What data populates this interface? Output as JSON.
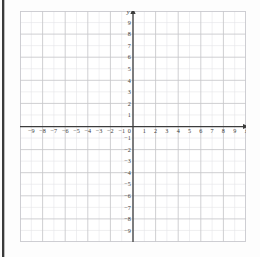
{
  "page": {
    "background_color": "#fdfdfd",
    "binding_edge_color": "#3a3a3a"
  },
  "chart_data": {
    "type": "scatter",
    "title": "",
    "subtitle": "",
    "xlabel": "x",
    "ylabel": "y",
    "xlim": [
      -10,
      10
    ],
    "ylim": [
      -10,
      10
    ],
    "x_tick_labels": [
      "-9",
      "-8",
      "-7",
      "-6",
      "-5",
      "-4",
      "-3",
      "-2",
      "-1",
      "1",
      "2",
      "3",
      "4",
      "5",
      "6",
      "7",
      "8",
      "9"
    ],
    "x_tick_values": [
      -9,
      -8,
      -7,
      -6,
      -5,
      -4,
      -3,
      -2,
      -1,
      1,
      2,
      3,
      4,
      5,
      6,
      7,
      8,
      9
    ],
    "y_tick_labels": [
      "9",
      "8",
      "7",
      "6",
      "5",
      "4",
      "3",
      "2",
      "1",
      "-1",
      "-2",
      "-3",
      "-4",
      "-5",
      "-6",
      "-7",
      "-8",
      "-9"
    ],
    "y_tick_values": [
      9,
      8,
      7,
      6,
      5,
      4,
      3,
      2,
      1,
      -1,
      -2,
      -3,
      -4,
      -5,
      -6,
      -7,
      -8,
      -9
    ],
    "origin_label": "0",
    "grid": true,
    "grid_minor_step": 1,
    "grid_major_step": 2,
    "grid_minor_color": "#e3e3e6",
    "grid_major_color": "#c4c4c8",
    "axis_color": "#3c3c3c",
    "legend": "none",
    "series": [],
    "values": [],
    "categories": [],
    "annotations": [
      {
        "text": "x",
        "position": "right-axis-end"
      },
      {
        "text": "y",
        "position": "top-axis-end"
      }
    ]
  }
}
